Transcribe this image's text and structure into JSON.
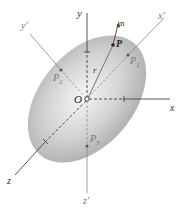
{
  "diagram": {
    "type": "ellipsoid-principal-axes",
    "colors": {
      "ellipsoid_light": "#f4f4f4",
      "ellipsoid_dark": "#a8a8a8",
      "axis": "#555555",
      "point": "#333333"
    },
    "labels": {
      "y": "y",
      "x": "x",
      "z": "z",
      "x_prime": "x'",
      "y_prime": "y'",
      "z_prime": "z'",
      "n": "n",
      "r": "r",
      "O": "O",
      "P": "P",
      "P1": "P",
      "P1_sub": "1",
      "P2": "P",
      "P2_sub": "2",
      "P3": "P",
      "P3_sub": "3"
    },
    "points": {
      "O": [
        87,
        99
      ],
      "P": [
        113,
        45
      ],
      "P1": [
        128,
        55
      ],
      "P2": [
        61,
        70
      ],
      "P3": [
        87,
        146
      ]
    }
  }
}
